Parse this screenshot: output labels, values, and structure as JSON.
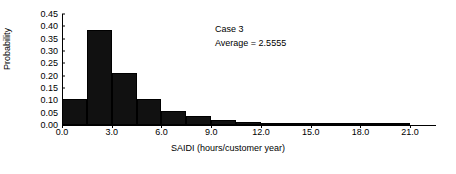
{
  "chart_data": {
    "type": "bar",
    "title": "",
    "xlabel": "SAIDI (hours/customer year)",
    "ylabel": "Probability",
    "xlim": [
      0.0,
      22.5
    ],
    "ylim": [
      0.0,
      0.45
    ],
    "grid": false,
    "legend": null,
    "bin_width": 1.5,
    "xticks": [
      "0.0",
      "3.0",
      "6.0",
      "9.0",
      "12.0",
      "15.0",
      "18.0",
      "21.0"
    ],
    "xtick_values": [
      0.0,
      3.0,
      6.0,
      9.0,
      12.0,
      15.0,
      18.0,
      21.0
    ],
    "yticks": [
      "0.00",
      "0.05",
      "0.10",
      "0.15",
      "0.20",
      "0.25",
      "0.30",
      "0.35",
      "0.40",
      "0.45"
    ],
    "ytick_values": [
      0.0,
      0.05,
      0.1,
      0.15,
      0.2,
      0.25,
      0.3,
      0.35,
      0.4,
      0.45
    ],
    "bin_starts": [
      0.0,
      1.5,
      3.0,
      4.5,
      6.0,
      7.5,
      9.0,
      10.5,
      12.0,
      13.5,
      15.0,
      16.5,
      18.0,
      19.5
    ],
    "categories": [
      "0.0-1.5",
      "1.5-3.0",
      "3.0-4.5",
      "4.5-6.0",
      "6.0-7.5",
      "7.5-9.0",
      "9.0-10.5",
      "10.5-12.0",
      "12.0-13.5",
      "13.5-15.0",
      "15.0-16.5",
      "16.5-18.0",
      "18.0-19.5",
      "19.5-21.0"
    ],
    "values": [
      0.105,
      0.385,
      0.21,
      0.105,
      0.055,
      0.035,
      0.022,
      0.012,
      0.007,
      0.004,
      0.003,
      0.002,
      0.001,
      0.001
    ],
    "annotations": [
      "Case 3",
      "Average = 2.5555"
    ],
    "colors": {
      "bar": "#111111",
      "axis": "#000000",
      "background": "#ffffff"
    }
  },
  "annotation": {
    "line1": "Case 3",
    "line2": "Average = 2.5555"
  }
}
